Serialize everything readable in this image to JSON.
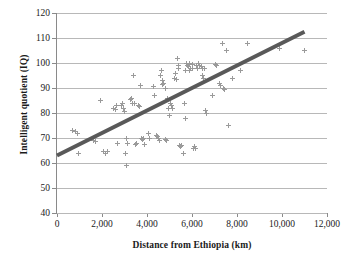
{
  "chart_data": {
    "type": "scatter",
    "title": "",
    "xlabel": "Distance from Ethiopia (km)",
    "ylabel": "Intelligent quotient (IQ)",
    "xlim": [
      0,
      12000
    ],
    "ylim": [
      40,
      120
    ],
    "xticks": [
      0,
      2000,
      4000,
      6000,
      8000,
      10000,
      12000
    ],
    "xticklabels": [
      "0",
      "2,000",
      "4,000",
      "6,000",
      "8,000",
      "10,000",
      "12,000"
    ],
    "yticks": [
      40,
      50,
      60,
      70,
      80,
      90,
      100,
      110,
      120
    ],
    "yticklabels": [
      "40",
      "50",
      "60",
      "70",
      "80",
      "90",
      "100",
      "110",
      "120"
    ],
    "grid": "horizontal",
    "legend": "none",
    "marker": "plus-cross",
    "marker_color": "#9a9a9a",
    "trendline": {
      "type": "linear",
      "color": "#595959",
      "width": 4,
      "x_start": 0,
      "y_start": 63,
      "x_end": 11000,
      "y_end": 112.5
    },
    "points": [
      [
        700,
        73
      ],
      [
        800,
        72.5
      ],
      [
        900,
        72
      ],
      [
        950,
        64
      ],
      [
        1600,
        69
      ],
      [
        1700,
        68.5
      ],
      [
        1950,
        85
      ],
      [
        2050,
        64.5
      ],
      [
        2150,
        64
      ],
      [
        2250,
        64.5
      ],
      [
        2500,
        82
      ],
      [
        2600,
        81.5
      ],
      [
        2650,
        83
      ],
      [
        2700,
        68
      ],
      [
        2850,
        83
      ],
      [
        2900,
        84
      ],
      [
        2950,
        82
      ],
      [
        3000,
        80.5
      ],
      [
        3050,
        64
      ],
      [
        3080,
        70
      ],
      [
        3100,
        59
      ],
      [
        3150,
        68
      ],
      [
        3250,
        85.5
      ],
      [
        3300,
        86
      ],
      [
        3350,
        84
      ],
      [
        3400,
        95
      ],
      [
        3450,
        84
      ],
      [
        3500,
        67.5
      ],
      [
        3550,
        68
      ],
      [
        3600,
        83
      ],
      [
        3650,
        82.5
      ],
      [
        3700,
        91
      ],
      [
        3750,
        70
      ],
      [
        3800,
        69.5
      ],
      [
        3850,
        70
      ],
      [
        3900,
        67.5
      ],
      [
        4050,
        72
      ],
      [
        4100,
        70
      ],
      [
        4300,
        90.5
      ],
      [
        4350,
        87
      ],
      [
        4400,
        71
      ],
      [
        4450,
        70.5
      ],
      [
        4500,
        70
      ],
      [
        4550,
        69
      ],
      [
        4600,
        95
      ],
      [
        4650,
        97
      ],
      [
        4680,
        93
      ],
      [
        4700,
        91.5
      ],
      [
        4750,
        92
      ],
      [
        4800,
        90
      ],
      [
        4820,
        69.5
      ],
      [
        4850,
        69
      ],
      [
        4900,
        86
      ],
      [
        4950,
        82
      ],
      [
        4980,
        79
      ],
      [
        5050,
        84
      ],
      [
        5100,
        83
      ],
      [
        5150,
        82
      ],
      [
        5200,
        94
      ],
      [
        5250,
        96
      ],
      [
        5300,
        93.5
      ],
      [
        5350,
        102
      ],
      [
        5380,
        99
      ],
      [
        5400,
        98
      ],
      [
        5450,
        67
      ],
      [
        5500,
        66.5
      ],
      [
        5550,
        67
      ],
      [
        5600,
        64
      ],
      [
        5700,
        97
      ],
      [
        5750,
        100
      ],
      [
        5800,
        99
      ],
      [
        5850,
        98.5
      ],
      [
        5880,
        100
      ],
      [
        5900,
        97
      ],
      [
        5950,
        98
      ],
      [
        6000,
        99.5
      ],
      [
        6020,
        98
      ],
      [
        5650,
        84
      ],
      [
        5700,
        78
      ],
      [
        6050,
        66
      ],
      [
        6100,
        66.5
      ],
      [
        6150,
        66
      ],
      [
        6200,
        99
      ],
      [
        6250,
        98
      ],
      [
        6300,
        100
      ],
      [
        6350,
        99
      ],
      [
        6400,
        98.5
      ],
      [
        6450,
        98
      ],
      [
        6480,
        95
      ],
      [
        6500,
        94
      ],
      [
        6550,
        98
      ],
      [
        6600,
        81
      ],
      [
        6650,
        80
      ],
      [
        6900,
        87
      ],
      [
        7050,
        99.5
      ],
      [
        7100,
        99
      ],
      [
        7200,
        92
      ],
      [
        7250,
        91
      ],
      [
        7350,
        108
      ],
      [
        7400,
        90
      ],
      [
        7450,
        89.5
      ],
      [
        7550,
        105
      ],
      [
        7600,
        75
      ],
      [
        7800,
        94
      ],
      [
        8150,
        97
      ],
      [
        8450,
        108
      ],
      [
        9900,
        106
      ],
      [
        11000,
        105
      ]
    ]
  }
}
